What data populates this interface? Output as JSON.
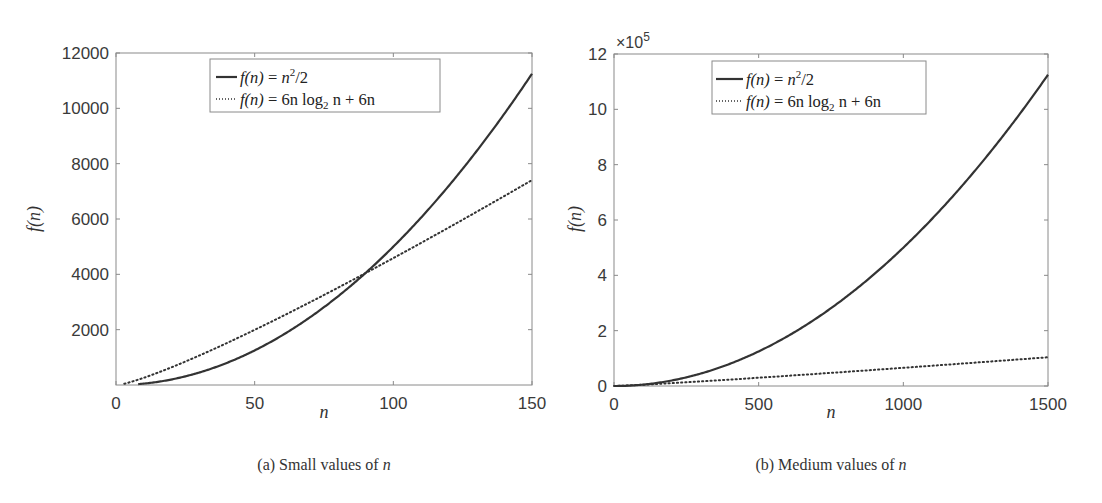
{
  "chart_data": [
    {
      "id": "a",
      "type": "line",
      "caption_prefix": "(a)",
      "caption_text": "Small values of ",
      "caption_var": "n",
      "xlabel": "n",
      "ylabel": "f(n)",
      "xlim": [
        0,
        150
      ],
      "ylim": [
        0,
        12000
      ],
      "xticks": [
        0,
        50,
        100,
        150
      ],
      "xtick_labels": [
        "0",
        "50",
        "100",
        "150"
      ],
      "yticks": [
        2000,
        4000,
        6000,
        8000,
        10000,
        12000
      ],
      "ytick_labels": [
        "2000",
        "4000",
        "6000",
        "8000",
        "10000",
        "12000"
      ],
      "y_exponent_label": "",
      "grid": false,
      "legend_position": "upper center",
      "x": [
        0,
        10,
        20,
        30,
        40,
        50,
        60,
        70,
        80,
        90,
        100,
        110,
        120,
        130,
        140,
        150
      ],
      "series": [
        {
          "name": "f(n) = n^2/2",
          "style": "solid",
          "values": [
            0,
            50,
            200,
            450,
            800,
            1250,
            1800,
            2450,
            3200,
            4050,
            5000,
            6050,
            7200,
            8450,
            9800,
            11250
          ]
        },
        {
          "name": "f(n) = 6n log2 n + 6n",
          "style": "dotted",
          "values": [
            0,
            259,
            639,
            1063,
            1517,
            1993,
            2486,
            2994,
            3514,
            4044,
            4586,
            5136,
            5694,
            6259,
            6831,
            7406
          ]
        }
      ]
    },
    {
      "id": "b",
      "type": "line",
      "caption_prefix": "(b)",
      "caption_text": "Medium values of ",
      "caption_var": "n",
      "xlabel": "n",
      "ylabel": "f(n)",
      "xlim": [
        0,
        1500
      ],
      "ylim": [
        0,
        1200000
      ],
      "xticks": [
        0,
        500,
        1000,
        1500
      ],
      "xtick_labels": [
        "0",
        "500",
        "1000",
        "1500"
      ],
      "yticks": [
        0,
        200000,
        400000,
        600000,
        800000,
        1000000,
        1200000
      ],
      "ytick_labels": [
        "0",
        "2",
        "4",
        "6",
        "8",
        "10",
        "12"
      ],
      "y_exponent_label": "×10^5",
      "grid": false,
      "legend_position": "upper center",
      "x": [
        0,
        100,
        200,
        300,
        400,
        500,
        600,
        700,
        800,
        900,
        1000,
        1100,
        1200,
        1300,
        1400,
        1500
      ],
      "series": [
        {
          "name": "f(n) = n^2/2",
          "style": "solid",
          "values": [
            0,
            5000,
            20000,
            45000,
            80000,
            125000,
            180000,
            245000,
            320000,
            405000,
            500000,
            605000,
            720000,
            845000,
            980000,
            1125000
          ]
        },
        {
          "name": "f(n) = 6n log2 n + 6n",
          "style": "dotted",
          "values": [
            0,
            4586,
            10372,
            16493,
            22344,
            29910,
            37002,
            44249,
            52127,
            59972,
            65795,
            72998,
            80541,
            89255,
            96024,
            104310
          ]
        }
      ]
    }
  ],
  "legend": {
    "entry1": {
      "lhs": "f(n)",
      "eq": " = ",
      "rhs_base": "n",
      "rhs_exp": "2",
      "rhs_tail": "/2"
    },
    "entry2": {
      "lhs": "f(n)",
      "eq": " = ",
      "rhs_a": "6n log",
      "rhs_sub": "2",
      "rhs_b": " n + 6n"
    }
  },
  "colors": {
    "line": "#333333",
    "axis": "#8a8a8a",
    "legend_border": "#8a8a8a"
  }
}
